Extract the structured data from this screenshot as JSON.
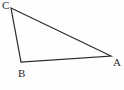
{
  "figure": {
    "type": "triangle-diagram",
    "background_color": "#fefefe",
    "stroke_color": "#2b2b2b",
    "stroke_width": 1.2,
    "canvas": {
      "width": 124,
      "height": 90
    },
    "vertices": [
      {
        "id": "C",
        "label": "C",
        "x": 11,
        "y": 8,
        "label_x": 2,
        "label_y": 0
      },
      {
        "id": "B",
        "label": "B",
        "x": 21,
        "y": 62,
        "label_x": 18,
        "label_y": 68
      },
      {
        "id": "A",
        "label": "A",
        "x": 111,
        "y": 56,
        "label_x": 113,
        "label_y": 57
      }
    ],
    "edges": [
      {
        "id": "CA",
        "from": "C",
        "to": "A"
      },
      {
        "id": "CB",
        "from": "C",
        "to": "B"
      },
      {
        "id": "BA",
        "from": "B",
        "to": "A"
      }
    ]
  }
}
